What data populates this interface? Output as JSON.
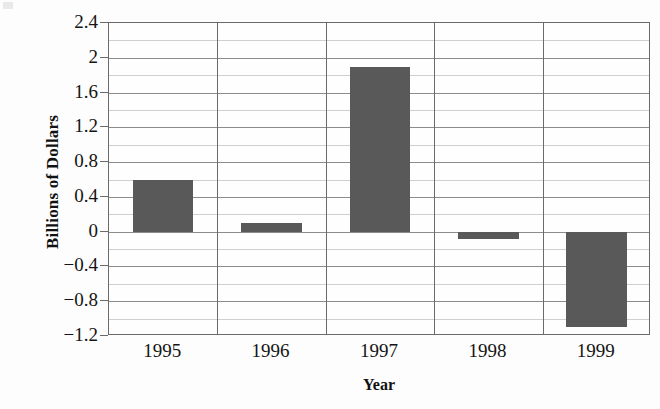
{
  "chart_data": {
    "type": "bar",
    "title": "",
    "xlabel": "Year",
    "ylabel": "Billions of Dollars",
    "categories": [
      "1995",
      "1996",
      "1997",
      "1998",
      "1999"
    ],
    "values": [
      0.6,
      0.1,
      1.9,
      -0.08,
      -1.1
    ],
    "series": [
      {
        "name": "Billions of Dollars",
        "values": [
          0.6,
          0.1,
          1.9,
          -0.08,
          -1.1
        ]
      }
    ],
    "ylim": [
      -1.2,
      2.4
    ],
    "y_major_ticks": [
      2.4,
      2,
      1.6,
      1.2,
      0.8,
      0.4,
      0,
      -0.4,
      -0.8,
      -1.2
    ],
    "y_tick_labels": [
      "2.4",
      "2",
      "1.6",
      "1.2",
      "0.8",
      "0.4",
      "0",
      "−0.4",
      "−0.8",
      "−1.2"
    ],
    "y_minor_step": 0.2,
    "grid": "horizontal-major-and-minor, vertical-category-separators",
    "legend": "none",
    "bar_color": "#595959",
    "gridline_color": "#8c8c8c",
    "minor_gridline_color": "#cfcfcf",
    "axis_color": "#6a6a6a",
    "background_color": "#ffffff"
  }
}
